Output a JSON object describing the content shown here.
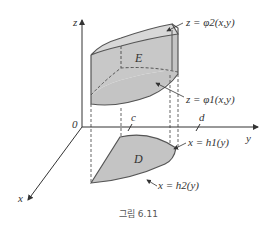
{
  "figure": {
    "caption": "그림 6.11",
    "region_E": "E",
    "region_D": "D",
    "axes": {
      "x": "x",
      "y": "y",
      "z": "z",
      "origin": "0"
    },
    "ticks": {
      "c": "c",
      "d": "d"
    },
    "surfaces": {
      "upper": "z = φ2(x,y)",
      "lower": "z = φ1(x,y)"
    },
    "boundaries": {
      "h1": "x = h1(y)",
      "h2": "x = h2(y)"
    },
    "colors": {
      "fill": "#c8c8c8",
      "top_fill": "#d8d8d8",
      "stroke": "#555555"
    }
  }
}
